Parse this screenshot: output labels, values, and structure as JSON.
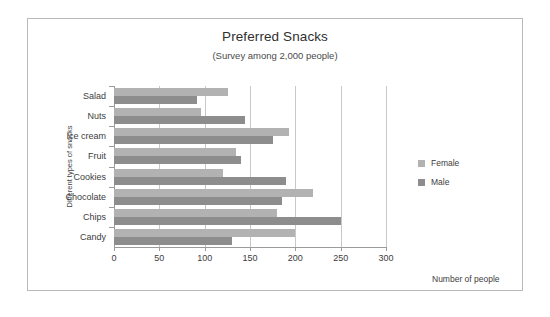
{
  "chart_data": {
    "type": "bar",
    "orientation": "horizontal",
    "title": "Preferred Snacks",
    "subtitle": "(Survey among 2,000 people)",
    "xlabel": "Number of people",
    "ylabel": "Different types of snacks",
    "xlim": [
      0,
      300
    ],
    "xticks": [
      0,
      50,
      100,
      150,
      200,
      250,
      300
    ],
    "xtick_labels": [
      "0",
      "50",
      "100",
      "150",
      "200",
      "250",
      "300"
    ],
    "grid": true,
    "legend_position": "right",
    "categories": [
      "Salad",
      "Nuts",
      "Ice cream",
      "Fruit",
      "Cookies",
      "Chocolate",
      "Chips",
      "Candy"
    ],
    "series": [
      {
        "name": "Female",
        "color": "#b2b2b2",
        "values": [
          126,
          96,
          193,
          135,
          120,
          220,
          180,
          200
        ]
      },
      {
        "name": "Male",
        "color": "#8d8d8d",
        "values": [
          92,
          145,
          175,
          140,
          190,
          185,
          250,
          130
        ]
      }
    ]
  },
  "legend": {
    "items": [
      {
        "label": "Female",
        "color": "#b2b2b2"
      },
      {
        "label": "Male",
        "color": "#8d8d8d"
      }
    ]
  }
}
